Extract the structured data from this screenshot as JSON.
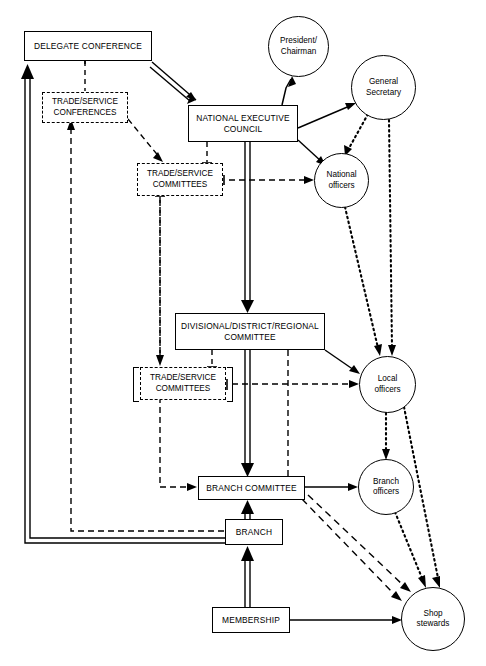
{
  "diagram": {
    "type": "organisational-flow-diagram",
    "background_color": "#ffffff",
    "line_color": "#000000",
    "nodes": [
      {
        "id": "delegate-conference",
        "label": "DELEGATE CONFERENCE",
        "shape": "rectangle",
        "line": "solid"
      },
      {
        "id": "trade-service-conferences",
        "label": "TRADE/SERVICE CONFERENCES",
        "line1": "TRADE/SERVICE",
        "line2": "CONFERENCES",
        "shape": "rectangle",
        "line": "dashed"
      },
      {
        "id": "national-executive-council",
        "label": "NATIONAL EXECUTIVE COUNCIL",
        "line1": "NATIONAL EXECUTIVE",
        "line2": "COUNCIL",
        "shape": "rectangle",
        "line": "solid"
      },
      {
        "id": "trade-service-committees-national",
        "label": "TRADE/SERVICE COMMITTEES",
        "line1": "TRADE/SERVICE",
        "line2": "COMMITTEES",
        "shape": "rectangle",
        "line": "dashed"
      },
      {
        "id": "divisional-district-regional-committee",
        "label": "DIVISIONAL/DISTRICT/REGIONAL COMMITTEE",
        "line1": "DIVISIONAL/DISTRICT/REGIONAL",
        "line2": "COMMITTEE",
        "shape": "rectangle",
        "line": "solid"
      },
      {
        "id": "trade-service-committees-regional",
        "label": "TRADE/SERVICE COMMITTEES",
        "line1": "TRADE/SERVICE",
        "line2": "COMMITTEES",
        "shape": "rectangle",
        "line": "dashed"
      },
      {
        "id": "branch-committee",
        "label": "BRANCH COMMITTEE",
        "shape": "rectangle",
        "line": "solid"
      },
      {
        "id": "branch",
        "label": "BRANCH",
        "shape": "rectangle",
        "line": "solid"
      },
      {
        "id": "membership",
        "label": "MEMBERSHIP",
        "shape": "rectangle",
        "line": "solid"
      },
      {
        "id": "president-chairman",
        "label": "President/ Chairman",
        "line1": "President/",
        "line2": "Chairman",
        "shape": "circle",
        "line": "solid"
      },
      {
        "id": "general-secretary",
        "label": "General Secretary",
        "line1": "General",
        "line2": "Secretary",
        "shape": "circle",
        "line": "solid"
      },
      {
        "id": "national-officers",
        "label": "National officers",
        "line1": "National",
        "line2": "officers",
        "shape": "circle",
        "line": "solid"
      },
      {
        "id": "local-officers",
        "label": "Local officers",
        "line1": "Local",
        "line2": "officers",
        "shape": "circle",
        "line": "solid"
      },
      {
        "id": "branch-officers",
        "label": "Branch officers",
        "line1": "Branch",
        "line2": "officers",
        "shape": "circle",
        "line": "solid"
      },
      {
        "id": "shop-stewards",
        "label": "Shop stewards",
        "line1": "Shop",
        "line2": "stewards",
        "shape": "circle",
        "line": "solid"
      }
    ],
    "edges": [
      {
        "from": "delegate-conference",
        "to": "national-executive-council",
        "style": "double-solid"
      },
      {
        "from": "delegate-conference",
        "to": "trade-service-conferences",
        "style": "dashed"
      },
      {
        "from": "trade-service-conferences",
        "to": "trade-service-committees-national",
        "style": "dashed"
      },
      {
        "from": "national-executive-council",
        "to": "president-chairman",
        "style": "solid"
      },
      {
        "from": "national-executive-council",
        "to": "general-secretary",
        "style": "solid"
      },
      {
        "from": "national-executive-council",
        "to": "national-officers",
        "style": "solid"
      },
      {
        "from": "national-executive-council",
        "to": "trade-service-committees-national",
        "style": "dashed"
      },
      {
        "from": "national-executive-council",
        "to": "divisional-district-regional-committee",
        "style": "double-solid"
      },
      {
        "from": "trade-service-committees-national",
        "to": "national-officers",
        "style": "dashed"
      },
      {
        "from": "general-secretary",
        "to": "national-officers",
        "style": "dotted"
      },
      {
        "from": "general-secretary",
        "to": "local-officers",
        "style": "dotted"
      },
      {
        "from": "national-officers",
        "to": "local-officers",
        "style": "dotted"
      },
      {
        "from": "divisional-district-regional-committee",
        "to": "local-officers",
        "style": "solid"
      },
      {
        "from": "divisional-district-regional-committee",
        "to": "trade-service-committees-regional",
        "style": "dashed"
      },
      {
        "from": "divisional-district-regional-committee",
        "to": "branch-committee",
        "style": "double-solid"
      },
      {
        "from": "trade-service-committees-regional",
        "to": "local-officers",
        "style": "dashed"
      },
      {
        "from": "trade-service-committees-regional",
        "to": "branch-committee",
        "style": "dashed"
      },
      {
        "from": "local-officers",
        "to": "branch-officers",
        "style": "dotted"
      },
      {
        "from": "local-officers",
        "to": "shop-stewards",
        "style": "dotted"
      },
      {
        "from": "branch-committee",
        "to": "branch-officers",
        "style": "solid"
      },
      {
        "from": "branch-committee",
        "to": "shop-stewards",
        "style": "dashed"
      },
      {
        "from": "branch-officers",
        "to": "shop-stewards",
        "style": "dotted"
      },
      {
        "from": "branch",
        "to": "branch-committee",
        "style": "double-solid"
      },
      {
        "from": "branch",
        "to": "delegate-conference",
        "style": "double-solid"
      },
      {
        "from": "branch",
        "to": "trade-service-conferences",
        "style": "dashed"
      },
      {
        "from": "membership",
        "to": "branch",
        "style": "double-solid"
      },
      {
        "from": "membership",
        "to": "shop-stewards",
        "style": "solid"
      }
    ]
  }
}
